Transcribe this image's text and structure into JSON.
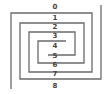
{
  "diagram": {
    "type": "double spiral with numbered crossings",
    "stroke_color": "#6a6a6a",
    "labels": [
      {
        "text": "0",
        "x": 55,
        "y": 3
      },
      {
        "text": "1",
        "x": 55,
        "y": 14
      },
      {
        "text": "2",
        "x": 55,
        "y": 23
      },
      {
        "text": "3",
        "x": 55,
        "y": 32
      },
      {
        "text": "4",
        "x": 55,
        "y": 42
      },
      {
        "text": "5",
        "x": 55,
        "y": 52
      },
      {
        "text": "6",
        "x": 55,
        "y": 61
      },
      {
        "text": "7",
        "x": 55,
        "y": 70
      },
      {
        "text": "8",
        "x": 55,
        "y": 82
      }
    ]
  }
}
